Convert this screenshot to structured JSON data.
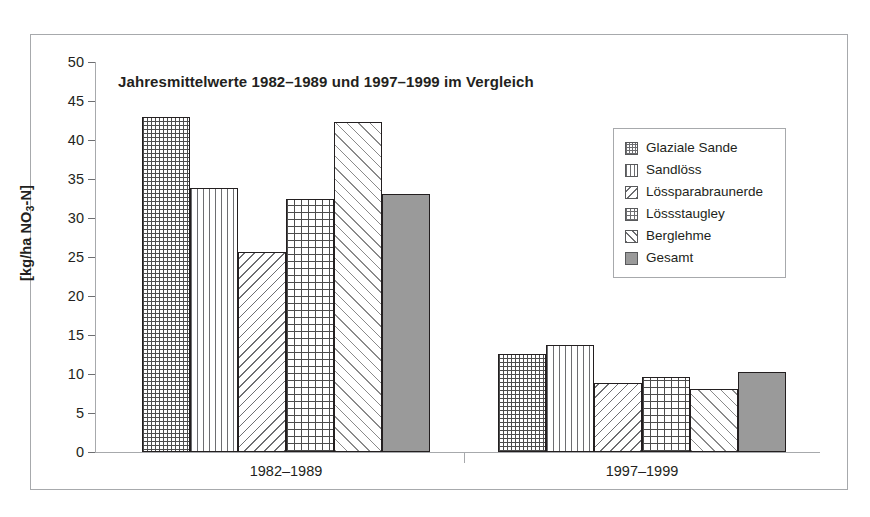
{
  "figure": {
    "title": "Jahresmittelwerte 1982–1989 und 1997–1999 im Vergleich",
    "y_axis_title_main": "[kg/ha NO",
    "y_axis_title_sub": "3",
    "y_axis_title_tail": "-N]"
  },
  "chart_data": {
    "type": "bar",
    "title": "Jahresmittelwerte 1982–1989 und 1997–1999 im Vergleich",
    "xlabel": "",
    "ylabel": "[kg/ha NO3-N]",
    "ylim": [
      0,
      50
    ],
    "yticks": [
      0,
      5,
      10,
      15,
      20,
      25,
      30,
      35,
      40,
      45,
      50
    ],
    "ytick_labels": [
      "0",
      "5",
      "10",
      "15",
      "20",
      "25",
      "30",
      "35",
      "40",
      "45",
      "50"
    ],
    "grid": false,
    "legend_position": "upper right",
    "categories": [
      "1982–1989",
      "1997–1999"
    ],
    "series": [
      {
        "name": "Glaziale Sande",
        "pattern": "dots",
        "values": [
          43.0,
          12.6
        ]
      },
      {
        "name": "Sandlöss",
        "pattern": "vertical-lines",
        "values": [
          33.8,
          13.7
        ]
      },
      {
        "name": "Lössparabraunerde",
        "pattern": "diagonal-back",
        "values": [
          25.7,
          8.9
        ]
      },
      {
        "name": "Lössstaugley",
        "pattern": "crosshatch",
        "values": [
          32.5,
          9.6
        ]
      },
      {
        "name": "Berglehme",
        "pattern": "diagonal-forward",
        "values": [
          42.3,
          8.1
        ]
      },
      {
        "name": "Gesamt",
        "pattern": "solid-gray",
        "values": [
          33.1,
          10.2
        ]
      }
    ]
  },
  "legend": {
    "items": [
      {
        "label": "Glaziale Sande",
        "swatch": "dots-swatch"
      },
      {
        "label": "Sandlöss",
        "swatch": "vertical-lines-swatch"
      },
      {
        "label": "Lössparabraunerde",
        "swatch": "diagonal-back-swatch"
      },
      {
        "label": "Lössstaugley",
        "swatch": "crosshatch-swatch"
      },
      {
        "label": "Berglehme",
        "swatch": "diagonal-forward-swatch"
      },
      {
        "label": "Gesamt",
        "swatch": "solid-gray-swatch"
      }
    ]
  },
  "colors": {
    "frame": "#a7a9ac",
    "axis": "#a7a9ac",
    "text": "#231f20",
    "bar_outline": "#231f20",
    "pattern_ink": "#6d6e71",
    "gesamt_fill": "#9a9a9a",
    "background": "#ffffff"
  }
}
